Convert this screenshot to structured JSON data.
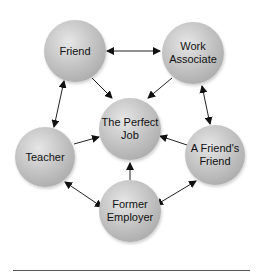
{
  "diagram": {
    "center": {
      "id": "perfect_job",
      "label": "The Perfect\nJob"
    },
    "nodes": [
      {
        "id": "friend",
        "label": "Friend"
      },
      {
        "id": "work_associate",
        "label": "Work\nAssociate"
      },
      {
        "id": "teacher",
        "label": "Teacher"
      },
      {
        "id": "friends_friend",
        "label": "A Friend's\nFriend"
      },
      {
        "id": "former_employer",
        "label": "Former\nEmployer"
      }
    ],
    "edges": [
      {
        "from": "friend",
        "to": "perfect_job",
        "type": "one-way"
      },
      {
        "from": "work_associate",
        "to": "perfect_job",
        "type": "one-way"
      },
      {
        "from": "teacher",
        "to": "perfect_job",
        "type": "one-way"
      },
      {
        "from": "friends_friend",
        "to": "perfect_job",
        "type": "one-way"
      },
      {
        "from": "former_employer",
        "to": "perfect_job",
        "type": "one-way"
      },
      {
        "from": "friend",
        "to": "work_associate",
        "type": "two-way"
      },
      {
        "from": "work_associate",
        "to": "friends_friend",
        "type": "two-way"
      },
      {
        "from": "friends_friend",
        "to": "former_employer",
        "type": "two-way"
      },
      {
        "from": "former_employer",
        "to": "teacher",
        "type": "two-way"
      },
      {
        "from": "teacher",
        "to": "friend",
        "type": "two-way"
      }
    ]
  }
}
